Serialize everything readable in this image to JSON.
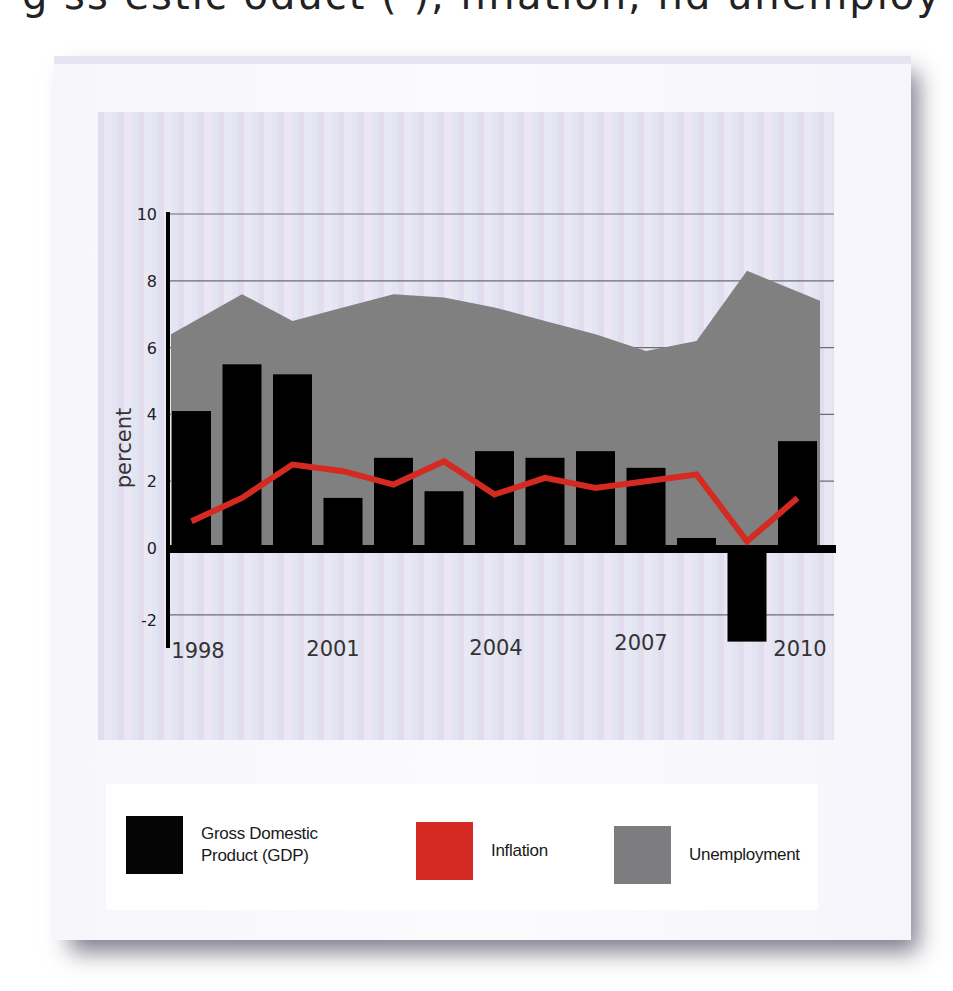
{
  "header_fragment": "g   ss     estic   oduct (    ),  nflation,  nd unemploy",
  "chart_data": {
    "type": "bar+line+area",
    "title": "",
    "xlabel": "",
    "ylabel": "percent",
    "ylim": [
      -2,
      10
    ],
    "yticks": [
      10,
      8,
      6,
      4,
      2,
      0,
      -2
    ],
    "ytick_labels": [
      "10",
      "8",
      "6",
      "4",
      "2",
      "0",
      "-2"
    ],
    "grid": true,
    "legend_position": "bottom",
    "categories": [
      "1998",
      "1999",
      "2000",
      "2001",
      "2002",
      "2003",
      "2004",
      "2005",
      "2006",
      "2007",
      "2008",
      "2009",
      "2010"
    ],
    "xtick_labels": [
      "1998",
      "2001",
      "2004",
      "2007",
      "2010"
    ],
    "series": [
      {
        "name": "Gross Domestic Product (GDP)",
        "type": "bar",
        "color": "#000000",
        "values": [
          4.1,
          5.5,
          5.2,
          1.5,
          2.7,
          1.7,
          2.9,
          2.7,
          2.9,
          2.4,
          0.3,
          -2.6,
          3.2
        ]
      },
      {
        "name": "Inflation",
        "type": "line",
        "color": "#d42a22",
        "values": [
          0.8,
          1.5,
          2.5,
          2.3,
          1.9,
          2.6,
          1.6,
          2.1,
          1.8,
          2.0,
          2.2,
          0.2,
          1.5
        ]
      },
      {
        "name": "Unemployment",
        "type": "area",
        "color": "#808080",
        "values": [
          6.4,
          7.6,
          6.8,
          7.2,
          7.6,
          7.5,
          7.2,
          6.8,
          6.4,
          5.9,
          6.2,
          8.3,
          7.4
        ]
      }
    ]
  },
  "legend": {
    "items": [
      {
        "label_line1": "Gross Domestic",
        "label_line2": "Product (GDP)",
        "color": "#050505"
      },
      {
        "label_line1": "Inflation",
        "label_line2": "",
        "color": "#d42a22"
      },
      {
        "label_line1": "Unemployment",
        "label_line2": "",
        "color": "#7d7d7f"
      }
    ]
  }
}
